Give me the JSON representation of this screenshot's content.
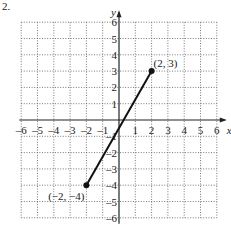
{
  "problem_number": "2.",
  "chart_data": {
    "type": "line",
    "title": "",
    "xlabel": "x",
    "ylabel": "y",
    "xlim": [
      -6,
      6
    ],
    "ylim": [
      -6,
      6
    ],
    "grid": true,
    "x_ticks": [
      "-6",
      "-5",
      "-4",
      "-3",
      "-2",
      "-1",
      "1",
      "2",
      "3",
      "4",
      "5",
      "6"
    ],
    "y_ticks": [
      "6",
      "5",
      "4",
      "3",
      "2",
      "1",
      "-1",
      "-2",
      "-3",
      "-4",
      "-5",
      "-6"
    ],
    "series": [
      {
        "name": "segment",
        "points": [
          [
            -2,
            -4
          ],
          [
            2,
            3
          ]
        ]
      }
    ],
    "annotations": [
      {
        "text": "(2, 3)",
        "x": 2,
        "y": 3
      },
      {
        "text": "(−2, −4)",
        "x": -2,
        "y": -4
      }
    ]
  }
}
